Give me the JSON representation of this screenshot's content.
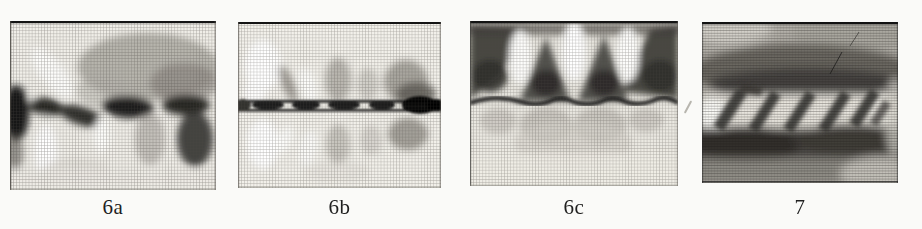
{
  "page": {
    "background": "#fafaf8",
    "paper_white": "#fbfbf9",
    "halftone_ink": "#1a1a1a",
    "label_color": "#1f1f1f"
  },
  "figure": {
    "panels": [
      {
        "id": "6a",
        "label": "6a"
      },
      {
        "id": "6b",
        "label": "6b"
      },
      {
        "id": "6c",
        "label": "6c"
      },
      {
        "id": "7",
        "label": "7"
      }
    ]
  }
}
